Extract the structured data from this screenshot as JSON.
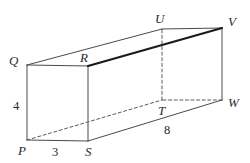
{
  "figure": {
    "background_color": "#ffffff",
    "line_color": "#4a4a4a",
    "bold_line_color": "#1a1a1a",
    "dashed_line_color": "#5a5a5a",
    "label_color": "#2b2b2b"
  },
  "vertices": [
    {
      "name": "P",
      "label": "P",
      "x": 27,
      "y": 140,
      "label_x": 18,
      "label_y": 155,
      "hidden": false
    },
    {
      "name": "S",
      "label": "S",
      "x": 88,
      "y": 141,
      "label_x": 85,
      "label_y": 156,
      "hidden": false
    },
    {
      "name": "R",
      "label": "R",
      "x": 88,
      "y": 66,
      "label_x": 80,
      "label_y": 62,
      "hidden": false
    },
    {
      "name": "Q",
      "label": "Q",
      "x": 27,
      "y": 65,
      "label_x": 9,
      "label_y": 65,
      "hidden": false
    },
    {
      "name": "T",
      "label": "T",
      "x": 162,
      "y": 100,
      "label_x": 158,
      "label_y": 115,
      "hidden": true
    },
    {
      "name": "W",
      "label": "W",
      "x": 222,
      "y": 100,
      "label_x": 228,
      "label_y": 107,
      "hidden": false
    },
    {
      "name": "V",
      "label": "V",
      "x": 222,
      "y": 28,
      "label_x": 228,
      "label_y": 26,
      "hidden": false
    },
    {
      "name": "U",
      "label": "U",
      "x": 162,
      "y": 29,
      "label_x": 155,
      "label_y": 23,
      "hidden": false
    }
  ],
  "edges": [
    {
      "name": "edge-P-S",
      "from": "P",
      "to": "S",
      "style": "solid",
      "weight": "normal"
    },
    {
      "name": "edge-S-R",
      "from": "S",
      "to": "R",
      "style": "solid",
      "weight": "normal"
    },
    {
      "name": "edge-R-Q",
      "from": "R",
      "to": "Q",
      "style": "solid",
      "weight": "normal"
    },
    {
      "name": "edge-Q-P",
      "from": "Q",
      "to": "P",
      "style": "solid",
      "weight": "normal"
    },
    {
      "name": "edge-U-V",
      "from": "U",
      "to": "V",
      "style": "solid",
      "weight": "normal"
    },
    {
      "name": "edge-V-W",
      "from": "V",
      "to": "W",
      "style": "solid",
      "weight": "normal"
    },
    {
      "name": "edge-W-T",
      "from": "W",
      "to": "T",
      "style": "dashed",
      "weight": "normal"
    },
    {
      "name": "edge-T-U",
      "from": "T",
      "to": "U",
      "style": "dashed",
      "weight": "normal"
    },
    {
      "name": "edge-Q-U",
      "from": "Q",
      "to": "U",
      "style": "solid",
      "weight": "normal"
    },
    {
      "name": "edge-R-V",
      "from": "R",
      "to": "V",
      "style": "solid",
      "weight": "bold"
    },
    {
      "name": "edge-S-W",
      "from": "S",
      "to": "W",
      "style": "solid",
      "weight": "normal"
    },
    {
      "name": "edge-P-T",
      "from": "P",
      "to": "T",
      "style": "dashed",
      "weight": "normal"
    }
  ],
  "dimensions": [
    {
      "name": "height-label",
      "value": "4",
      "x": 16,
      "y": 110,
      "describes": "edge P to Q"
    },
    {
      "name": "width-label",
      "value": "3",
      "x": 55,
      "y": 156,
      "describes": "edge P to S"
    },
    {
      "name": "depth-label",
      "value": "8",
      "x": 167,
      "y": 134,
      "describes": "edge S to W"
    }
  ]
}
